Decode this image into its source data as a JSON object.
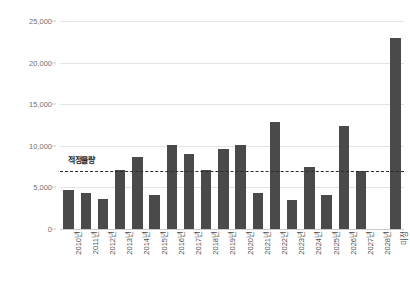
{
  "chart_data": {
    "type": "bar",
    "title": "",
    "subtitle": "",
    "xlabel": "",
    "ylabel": "",
    "ylim": [
      0,
      25000
    ],
    "ytick_labels": [
      "0",
      "5,000",
      "10,000",
      "15,000",
      "20,000",
      "25,000"
    ],
    "ytick_values": [
      0,
      5000,
      10000,
      15000,
      20000,
      25000
    ],
    "grid": true,
    "legend": "none",
    "categories": [
      "2010년",
      "2011년",
      "2012년",
      "2013년",
      "2014년",
      "2015년",
      "2016년",
      "2017년",
      "2018년",
      "2019년",
      "2020년",
      "2021년",
      "2022년",
      "2023년",
      "2024년",
      "2025년",
      "2026년",
      "2027년",
      "2028년",
      "미정"
    ],
    "values": [
      4700,
      4350,
      3600,
      7150,
      8650,
      4050,
      10150,
      9000,
      7050,
      9650,
      10150,
      4300,
      12900,
      3500,
      7450,
      4050,
      12350,
      7000,
      0,
      23000
    ],
    "bar_color": "#4a4a4a",
    "annotations": [
      {
        "name": "reference-line",
        "label": "적정물량",
        "value": 7000,
        "style": "dashed",
        "color": "#2b2b2b"
      }
    ]
  }
}
